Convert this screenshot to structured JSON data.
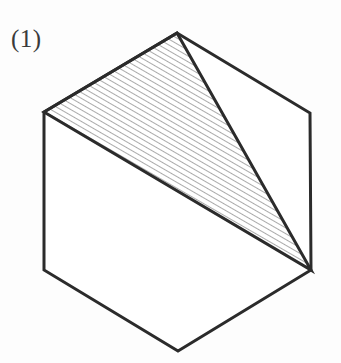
{
  "figure": {
    "label": "(1)",
    "canvas": {
      "width": 341,
      "height": 363,
      "background": "#fdfdfd"
    },
    "colors": {
      "outline": "#2b2b2b",
      "hatch": "#555555",
      "fill": "#ffffff",
      "label": "#3a3a3a"
    },
    "strokes": {
      "outline_width": 3,
      "triangle_width": 3,
      "hatch_width": 1,
      "hatch_spacing": 5,
      "hatch_angle_deg": 60
    },
    "shapes": {
      "hexagon": {
        "name": "hexagon",
        "points": "177,33 310,113 311,270 178,351 44,270 44,112",
        "vertices": [
          {
            "name": "top",
            "x": 177,
            "y": 33
          },
          {
            "name": "upper-right",
            "x": 310,
            "y": 113
          },
          {
            "name": "lower-right",
            "x": 311,
            "y": 270
          },
          {
            "name": "bottom",
            "x": 178,
            "y": 351
          },
          {
            "name": "lower-left",
            "x": 44,
            "y": 270
          },
          {
            "name": "upper-left",
            "x": 44,
            "y": 112
          }
        ]
      },
      "hatched_triangle": {
        "name": "hatched-triangle",
        "points": "177,33 311,270 44,112",
        "vertices": [
          {
            "name": "apex-top",
            "x": 177,
            "y": 33
          },
          {
            "name": "lower-right",
            "x": 311,
            "y": 270
          },
          {
            "name": "upper-left",
            "x": 44,
            "y": 112
          }
        ]
      }
    }
  }
}
